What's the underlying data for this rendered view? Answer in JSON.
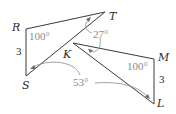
{
  "figure": {
    "type": "geometry-diagram",
    "triangles": [
      {
        "name": "RST",
        "vertices": {
          "R": {
            "label": "R",
            "x": 26,
            "y": 29
          },
          "S": {
            "label": "S",
            "x": 26,
            "y": 76
          },
          "T": {
            "label": "T",
            "x": 105,
            "y": 12
          }
        },
        "side_label": "3",
        "angle_label": "100°"
      },
      {
        "name": "MKL",
        "vertices": {
          "K": {
            "label": "K",
            "x": 73,
            "y": 43
          },
          "M": {
            "label": "M",
            "x": 154,
            "y": 59
          },
          "L": {
            "label": "L",
            "x": 154,
            "y": 104
          }
        },
        "side_label": "3",
        "angle_label": "100°"
      }
    ],
    "angle_annotations": [
      {
        "label": "27°",
        "targets": [
          "T",
          "K"
        ]
      },
      {
        "label": "53°",
        "targets": [
          "S",
          "L"
        ]
      }
    ],
    "colors": {
      "edge": "#3a3a3a",
      "annotation": "#8a8a8a"
    }
  }
}
